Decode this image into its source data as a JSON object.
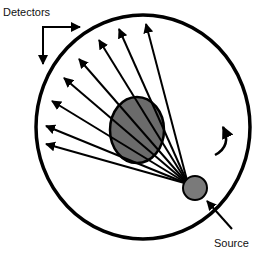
{
  "labels": {
    "detectors": "Detectors",
    "source": "Source"
  },
  "colors": {
    "line": "#000000",
    "object_fill": "#6b6b6b",
    "source_fill": "#7a7a7a",
    "background": "#ffffff"
  },
  "diagram": {
    "gantry_circle": {
      "cx": 143,
      "cy": 127,
      "rx": 108,
      "ry": 113
    },
    "object_ellipse": {
      "cx": 137,
      "cy": 130,
      "rx": 27,
      "ry": 33
    },
    "source_circle": {
      "cx": 195,
      "cy": 188,
      "r": 12
    },
    "ray_origin": [
      188,
      184
    ],
    "ray_tips": [
      [
        145,
        22
      ],
      [
        118,
        27
      ],
      [
        98,
        38
      ],
      [
        78,
        57
      ],
      [
        63,
        76
      ],
      [
        50,
        100
      ],
      [
        44,
        125
      ],
      [
        44,
        143
      ]
    ],
    "rotation_arrow": "clockwise-curved-arrow",
    "source_pointer": "arrow-to-source",
    "detectors_pointer": "elbow-arrows-to-detector-ring"
  }
}
